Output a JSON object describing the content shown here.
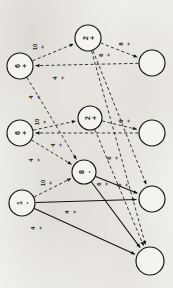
{
  "figure": {
    "orientation": "rotated-90",
    "background_color": "#f2f0ec",
    "ink_color": "#111111"
  },
  "chart_data": {
    "type": "diagram",
    "title": "",
    "subtitle": "",
    "xlabel": "",
    "ylabel": "",
    "layout": "rotated network graph, four columns of nodes",
    "nodes": [
      {
        "id": "n1",
        "label": "2 +",
        "value": "2",
        "sign": "+",
        "filled": false,
        "cx": 88,
        "cy": 38,
        "r": 13
      },
      {
        "id": "n2",
        "label": "6 +",
        "value": "6",
        "sign": "+",
        "filled": false,
        "cx": 20,
        "cy": 66,
        "r": 13
      },
      {
        "id": "n3",
        "label": "",
        "value": "",
        "sign": "",
        "filled": false,
        "cx": 152,
        "cy": 63,
        "r": 13
      },
      {
        "id": "n4",
        "label": "2 +",
        "value": "2",
        "sign": "+",
        "filled": false,
        "cx": 90,
        "cy": 118,
        "r": 12
      },
      {
        "id": "n5",
        "label": "6 +",
        "value": "6",
        "sign": "+",
        "filled": false,
        "cx": 20,
        "cy": 133,
        "r": 13
      },
      {
        "id": "n6",
        "label": "",
        "value": "",
        "sign": "",
        "filled": false,
        "cx": 152,
        "cy": 133,
        "r": 13
      },
      {
        "id": "n7",
        "label": "8 -",
        "value": "8",
        "sign": "-",
        "filled": false,
        "cx": 84,
        "cy": 172,
        "r": 12
      },
      {
        "id": "n8",
        "label": "1 -",
        "value": "1",
        "sign": "-",
        "filled": false,
        "cx": 22,
        "cy": 203,
        "r": 13
      },
      {
        "id": "n9",
        "label": "",
        "value": "",
        "sign": "",
        "filled": false,
        "cx": 152,
        "cy": 199,
        "r": 13
      },
      {
        "id": "n10",
        "label": "",
        "value": "",
        "sign": "",
        "filled": false,
        "cx": 150,
        "cy": 261,
        "r": 14
      }
    ],
    "edges": [
      {
        "from": "n2",
        "to": "n1",
        "style": "dashed",
        "weight": "10",
        "sign": "+",
        "label": "10 +"
      },
      {
        "from": "n1",
        "to": "n3",
        "style": "dashed",
        "weight": "8",
        "sign": "+",
        "label": "8 +"
      },
      {
        "from": "n3",
        "to": "n2",
        "style": "dashed",
        "weight": "4",
        "sign": "+",
        "label": "4 +"
      },
      {
        "from": "n1",
        "to": "n9",
        "style": "dashed",
        "weight": "6",
        "sign": "+",
        "label": "6 +"
      },
      {
        "from": "n1",
        "to": "n10",
        "style": "dashed",
        "weight": "",
        "sign": "",
        "label": ""
      },
      {
        "from": "n2",
        "to": "n7",
        "style": "dashed",
        "weight": "4",
        "sign": "+",
        "label": "4 +"
      },
      {
        "from": "n5",
        "to": "n4",
        "style": "dashed",
        "weight": "10",
        "sign": "+",
        "label": "10 +"
      },
      {
        "from": "n4",
        "to": "n6",
        "style": "dashed",
        "weight": "6",
        "sign": "+",
        "label": "6 +"
      },
      {
        "from": "n6",
        "to": "n5",
        "style": "dashed",
        "weight": "4",
        "sign": "+",
        "label": "4 +"
      },
      {
        "from": "n4",
        "to": "n10",
        "style": "dashed",
        "weight": "6",
        "sign": "+",
        "label": "6 +"
      },
      {
        "from": "n5",
        "to": "n7",
        "style": "dashed",
        "weight": "4",
        "sign": "+",
        "label": "4 +"
      },
      {
        "from": "n8",
        "to": "n7",
        "style": "dashed",
        "weight": "10",
        "sign": "+",
        "label": "10 +"
      },
      {
        "from": "n7",
        "to": "n9",
        "style": "solid",
        "weight": "6",
        "sign": "+",
        "label": "6 +"
      },
      {
        "from": "n7",
        "to": "n10",
        "style": "solid",
        "weight": "",
        "sign": "",
        "label": ""
      },
      {
        "from": "n8",
        "to": "n9",
        "style": "solid",
        "weight": "4",
        "sign": "+",
        "label": "4 +"
      },
      {
        "from": "n8",
        "to": "n10",
        "style": "solid",
        "weight": "4",
        "sign": "+",
        "label": "4 +"
      }
    ],
    "edge_labels": [
      {
        "id": "l1",
        "text": "10",
        "sign": "+",
        "x": 38,
        "y": 47
      },
      {
        "id": "l2",
        "text": "8",
        "sign": "+",
        "x": 124,
        "y": 44
      },
      {
        "id": "l3",
        "text": "6",
        "sign": "+",
        "x": 104,
        "y": 55
      },
      {
        "id": "l4",
        "text": "4",
        "sign": "+",
        "x": 58,
        "y": 78
      },
      {
        "id": "l5",
        "text": "4",
        "sign": "+",
        "x": 34,
        "y": 97
      },
      {
        "id": "l6",
        "text": "10",
        "sign": "+",
        "x": 40,
        "y": 122
      },
      {
        "id": "l7",
        "text": "6",
        "sign": "+",
        "x": 124,
        "y": 121
      },
      {
        "id": "l8",
        "text": "4",
        "sign": "+",
        "x": 56,
        "y": 145
      },
      {
        "id": "l9",
        "text": "4",
        "sign": "+",
        "x": 34,
        "y": 160
      },
      {
        "id": "l10",
        "text": "6",
        "sign": "+",
        "x": 112,
        "y": 158
      },
      {
        "id": "l11",
        "text": "10",
        "sign": "+",
        "x": 46,
        "y": 183
      },
      {
        "id": "l12",
        "text": "6",
        "sign": "+",
        "x": 102,
        "y": 184
      },
      {
        "id": "l13",
        "text": "6",
        "sign": "+",
        "x": 122,
        "y": 185
      },
      {
        "id": "l14",
        "text": "4",
        "sign": "+",
        "x": 70,
        "y": 212
      },
      {
        "id": "l15",
        "text": "4",
        "sign": "+",
        "x": 36,
        "y": 228
      }
    ],
    "legend": [],
    "annotations": []
  }
}
